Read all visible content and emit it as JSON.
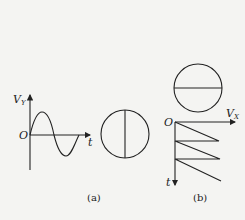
{
  "figure_a": {
    "y_axis_label": "V",
    "y_axis_sub": "Y",
    "origin_label": "O",
    "x_axis_label": "t",
    "caption": "(a)",
    "waveform": "sine",
    "screen_pattern": "vertical-line"
  },
  "figure_b": {
    "x_axis_label": "V",
    "x_axis_sub": "X",
    "origin_label": "O",
    "t_axis_label": "t",
    "caption": "(b)",
    "waveform": "sawtooth",
    "screen_pattern": "horizontal-line"
  },
  "colors": {
    "ink": "#222222",
    "paper": "#f4f4f2"
  }
}
